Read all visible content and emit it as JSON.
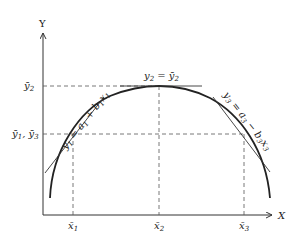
{
  "diagram": {
    "type": "concave-curve-with-tangents",
    "axes": {
      "y_label": "Y",
      "x_label": "X"
    },
    "y_ticks": [
      {
        "base": "ȳ",
        "sub": "2",
        "text": "ȳ2"
      },
      {
        "text": "ȳ1, ȳ3",
        "parts": [
          {
            "base": "ȳ",
            "sub": "1"
          },
          {
            "base": ", ȳ",
            "sub": "3"
          }
        ]
      }
    ],
    "x_ticks": [
      {
        "base": "x̄",
        "sub": "1",
        "text": "x̄1"
      },
      {
        "base": "x̄",
        "sub": "2",
        "text": "x̄2"
      },
      {
        "base": "x̄",
        "sub": "3",
        "text": "x̄3"
      }
    ],
    "tangents": [
      {
        "id": "tangent-1",
        "equation": "y1 = a1 + b1x1"
      },
      {
        "id": "tangent-2",
        "equation": "y2 = ȳ2"
      },
      {
        "id": "tangent-3",
        "equation": "y3 = a3 − b3x3"
      }
    ],
    "colors": {
      "line": "#222222",
      "dashed": "#555555"
    }
  }
}
